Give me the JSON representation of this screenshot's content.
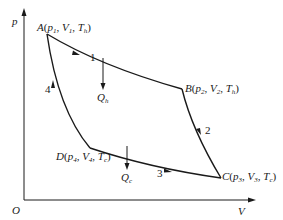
{
  "diagram": {
    "type": "p-V diagram (Carnot cycle)",
    "axes": {
      "y_label": "p",
      "x_label": "V",
      "origin_label": "O"
    },
    "points": [
      {
        "id": "A",
        "label": "A",
        "state": "(p1, V1, Th)",
        "p": "p",
        "p_sub": "1",
        "v": "V",
        "v_sub": "1",
        "t": "T",
        "t_sub": "h"
      },
      {
        "id": "B",
        "label": "B",
        "state": "(p2, V2, Th)",
        "p": "p",
        "p_sub": "2",
        "v": "V",
        "v_sub": "2",
        "t": "T",
        "t_sub": "h"
      },
      {
        "id": "C",
        "label": "C",
        "state": "(p3, V3, Tc)",
        "p": "p",
        "p_sub": "3",
        "v": "V",
        "v_sub": "3",
        "t": "T",
        "t_sub": "c"
      },
      {
        "id": "D",
        "label": "D",
        "state": "(p4, V4, Tc)",
        "p": "p",
        "p_sub": "4",
        "v": "V",
        "v_sub": "4",
        "t": "T",
        "t_sub": "c"
      }
    ],
    "processes": [
      {
        "number": "1",
        "from": "A",
        "to": "B"
      },
      {
        "number": "2",
        "from": "B",
        "to": "C"
      },
      {
        "number": "3",
        "from": "D",
        "to": "C"
      },
      {
        "number": "4",
        "from": "D",
        "to": "A"
      }
    ],
    "heat": {
      "hot": {
        "symbol": "Q",
        "sub": "h"
      },
      "cold": {
        "symbol": "Q",
        "sub": "c"
      }
    },
    "colors": {
      "line": "#1a1a1a",
      "background": "#ffffff"
    }
  }
}
